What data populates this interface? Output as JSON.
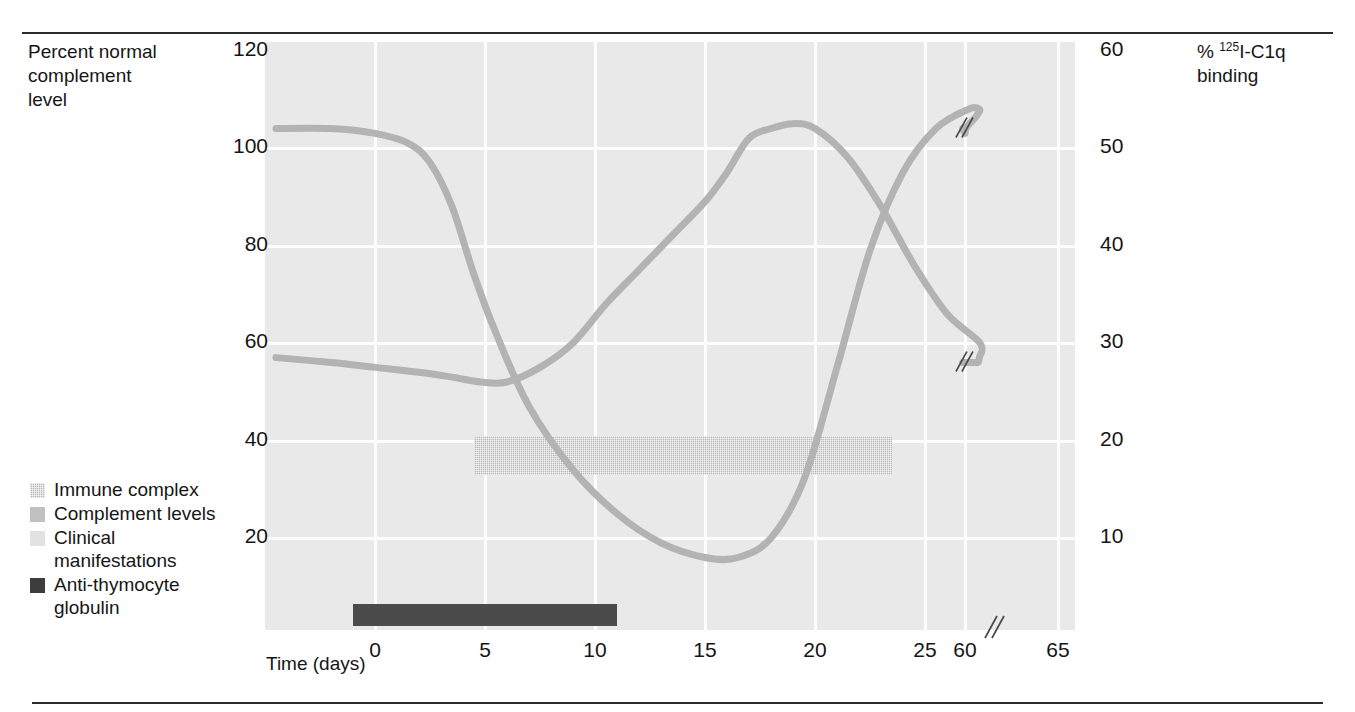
{
  "axes": {
    "left_title": "Percent normal\ncomplement\nlevel",
    "right_title_prefix": "% ",
    "right_title_sup": "125",
    "right_title_rest": "I-C1q\nbinding",
    "x_title": "Time (days)"
  },
  "ticks": {
    "y_left": [
      "120",
      "100",
      "80",
      "60",
      "40",
      "20"
    ],
    "y_right": [
      "60",
      "50",
      "40",
      "30",
      "20",
      "10"
    ],
    "x": [
      "0",
      "5",
      "10",
      "15",
      "20",
      "25",
      "60",
      "65"
    ]
  },
  "legend": [
    {
      "label": "Immune complex",
      "swatch": "hatch-swatch-icon",
      "color": "#b6b6b6"
    },
    {
      "label": "Complement levels",
      "swatch": "solid-swatch-icon",
      "color": "#c0c0c0"
    },
    {
      "label": "Clinical\nmanifestations",
      "swatch": "light-swatch-icon",
      "color": "#e2e2e2"
    },
    {
      "label": "Anti-thymocyte\nglobulin",
      "swatch": "dark-swatch-icon",
      "color": "#3d3d3d"
    }
  ],
  "colors": {
    "plot_background": "#e9e9e9",
    "gridline": "#fdfdfd",
    "curve": "#b3b3b3",
    "clinical_bar": "#b9b9b9",
    "atg_bar": "#4b4b4b",
    "rule": "#2b2b2b"
  },
  "bars": {
    "clinical": {
      "start_day": 4.5,
      "end_day": 23.5,
      "top_value": 41,
      "bottom_value": 33
    },
    "atg": {
      "start_day": -1.0,
      "end_day": 11.0
    }
  },
  "chart_data": {
    "type": "line",
    "title": "",
    "xlabel": "Time (days)",
    "ylabel": "Percent normal complement level",
    "y2label": "% 125I-C1q binding",
    "xlim": [
      -4.5,
      66
    ],
    "ylim": [
      0,
      120
    ],
    "y2lim": [
      0,
      60
    ],
    "grid": true,
    "legend_position": "lower-left-outside",
    "axis_break_x": [
      55,
      57
    ],
    "curve_break_marker_day": 58,
    "series": [
      {
        "name": "Complement levels",
        "axis": "left",
        "points": [
          [
            -4.5,
            104
          ],
          [
            -2,
            104
          ],
          [
            0,
            103
          ],
          [
            1.5,
            101
          ],
          [
            2.5,
            97
          ],
          [
            3.5,
            88
          ],
          [
            4.5,
            74
          ],
          [
            5.5,
            62
          ],
          [
            7,
            47
          ],
          [
            9,
            34
          ],
          [
            11,
            25
          ],
          [
            13,
            19
          ],
          [
            15,
            16
          ],
          [
            16.5,
            16
          ],
          [
            18,
            20
          ],
          [
            19.5,
            32
          ],
          [
            21,
            55
          ],
          [
            22.5,
            79
          ],
          [
            24,
            95
          ],
          [
            25.5,
            104
          ],
          [
            27,
            108
          ],
          [
            29,
            108
          ],
          [
            32,
            107
          ],
          [
            40,
            106
          ],
          [
            50,
            105
          ],
          [
            58,
            104
          ],
          [
            60,
            103
          ],
          [
            65,
            104
          ]
        ]
      },
      {
        "name": "Immune complex",
        "axis": "right",
        "points": [
          [
            -4.5,
            28.5
          ],
          [
            -2,
            28
          ],
          [
            0,
            27.5
          ],
          [
            2,
            27
          ],
          [
            3.5,
            26.5
          ],
          [
            4.8,
            26
          ],
          [
            6,
            26
          ],
          [
            7.5,
            27.5
          ],
          [
            9,
            30
          ],
          [
            10.5,
            34
          ],
          [
            12,
            37.5
          ],
          [
            13.5,
            41
          ],
          [
            15,
            44.5
          ],
          [
            16,
            47.5
          ],
          [
            17,
            51
          ],
          [
            18,
            52
          ],
          [
            19,
            52.5
          ],
          [
            20,
            52
          ],
          [
            21.5,
            49
          ],
          [
            23,
            44
          ],
          [
            24.5,
            38
          ],
          [
            26,
            33
          ],
          [
            27.5,
            30
          ],
          [
            29,
            28.5
          ],
          [
            32,
            28
          ],
          [
            40,
            28
          ],
          [
            50,
            28
          ],
          [
            58,
            28
          ],
          [
            60,
            28
          ],
          [
            65,
            28
          ]
        ]
      }
    ]
  }
}
